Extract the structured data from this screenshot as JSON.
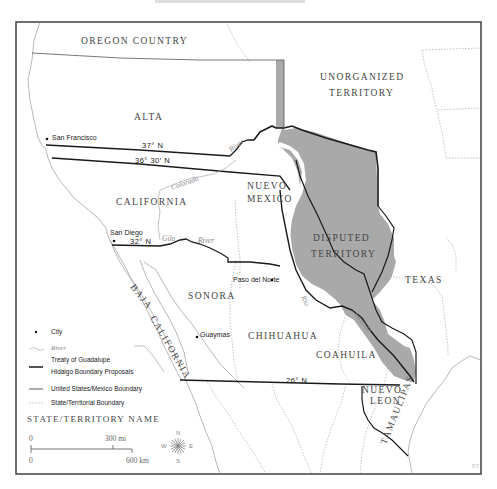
{
  "map": {
    "title_cropped": "",
    "regions": {
      "oregon_country": "OREGON   COUNTRY",
      "unorganized_territory_line1": "UNORGANIZED",
      "unorganized_territory_line2": "TERRITORY",
      "alta": "ALTA",
      "california": "CALIFORNIA",
      "nuevo_mexico_line1": "NUEVO",
      "nuevo_mexico_line2": "MEXICO",
      "disputed_territory_line1": "DISPUTED",
      "disputed_territory_line2": "TERRITORY",
      "texas": "TEXAS",
      "sonora": "SONORA",
      "chihuahua": "CHIHUAHUA",
      "coahuila": "COAHUILA",
      "baja": "BAJA",
      "baja_california": "CALIFORNIA",
      "nuevo_leon_line1": "NUEVO",
      "nuevo_leon_line2": "LEON",
      "tamaulipas": "TAMAULIPAS"
    },
    "cities": [
      {
        "name": "San Francisco"
      },
      {
        "name": "San Diego"
      },
      {
        "name": "Paso del Norte"
      },
      {
        "name": "Guaymas"
      }
    ],
    "latitudes": {
      "lat_37": "37° N",
      "lat_36_30": "36° 30′ N",
      "lat_32": "32° N",
      "lat_26": "26° N"
    },
    "rivers": {
      "colorado": "Colorado",
      "gila": "Gila",
      "gila_river": "River",
      "north_river": "River",
      "rio": "Rio",
      "grande": "Grande"
    },
    "legend": {
      "city": "City",
      "river": "River",
      "treaty_line1": "Treaty of Guadalupe",
      "treaty_line2": "Hidalgo Boundary Proposals",
      "us_mexico": "United States/Mexico Boundary",
      "state_boundary": "State/Territorial Boundary",
      "state_name": "STATE/TERRITORY NAME"
    },
    "scale": {
      "zero_top": "0",
      "miles": "300 mi",
      "zero_bottom": "0",
      "km": "600 km"
    },
    "compass": {
      "n": "N",
      "s": "S",
      "e": "E",
      "w": "W"
    },
    "credit": "ET",
    "colors": {
      "disputed_fill": "#a9a9a9",
      "frame": "#333333",
      "treaty_line": "#1a1a1a",
      "dotted_boundary": "#999999",
      "river": "#aaaaaa"
    }
  }
}
